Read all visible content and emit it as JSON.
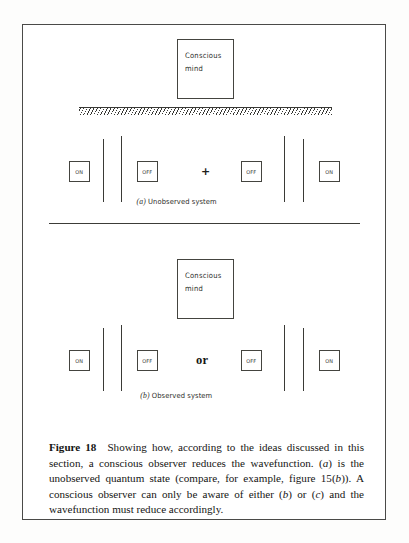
{
  "figure": {
    "number_label": "Figure 18",
    "caption_parts": {
      "s1": "Showing how, according to the ideas discussed in this section, a conscious observer reduces the wavefunction. (",
      "a1": "a",
      "s2": ") is the unobserved quantum state (compare, for example, figure 15(",
      "b1": "b",
      "s3": ")). A conscious observer can only be aware of either (",
      "b2": "b",
      "s4": ") or (",
      "c1": "c",
      "s5": ") and the wavefunction must reduce accordingly."
    }
  },
  "panel_a": {
    "label_prefix": "(",
    "label_letter": "a",
    "label_suffix": ")",
    "label_text": " Unobserved system",
    "mind_box": {
      "line1": "Conscious",
      "line2": "mind"
    },
    "barrier": "hatched-barrier",
    "operator": "+",
    "states": [
      {
        "label": "ON"
      },
      {
        "label": "OFF"
      },
      {
        "label": "OFF"
      },
      {
        "label": "ON"
      }
    ]
  },
  "panel_b": {
    "label_prefix": "(",
    "label_letter": "b",
    "label_suffix": ")",
    "label_text": " Observed system",
    "mind_box": {
      "line1": "Conscious",
      "line2": "mind"
    },
    "operator": "or",
    "states": [
      {
        "label": "ON"
      },
      {
        "label": "OFF"
      },
      {
        "label": "OFF"
      },
      {
        "label": "ON"
      }
    ]
  },
  "colors": {
    "ink": "#2c2c29",
    "rule": "#3c3c38",
    "page": "#ffffff"
  }
}
